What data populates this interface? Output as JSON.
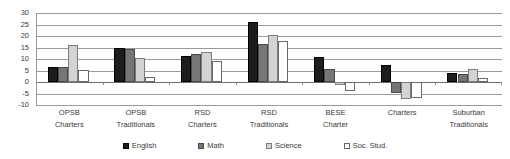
{
  "chart_data": {
    "type": "bar",
    "title": "",
    "subtitle": "",
    "xlabel": "",
    "ylabel": "",
    "ylim": [
      -10,
      30
    ],
    "ytick_step": 5,
    "yticks": [
      30,
      25,
      20,
      15,
      10,
      5,
      0,
      -5,
      -10
    ],
    "ytick_labels": [
      "30",
      "25",
      "20",
      "15",
      "10",
      "5",
      "0",
      "-5",
      "-10"
    ],
    "grid": true,
    "legend_position": "bottom",
    "categories": [
      "OPSB\nCharters",
      "OPSB\nTraditionals",
      "RSD\nCharters",
      "RSD\nTraditionals",
      "BESE\nCharter",
      "Charters",
      "Suburban\nTraditionals"
    ],
    "category_lines": [
      [
        "OPSB",
        "Charters"
      ],
      [
        "OPSB",
        "Traditionals"
      ],
      [
        "RSD",
        "Charters"
      ],
      [
        "RSD",
        "Traditionals"
      ],
      [
        "BESE",
        "Charter"
      ],
      [
        "Charters",
        ""
      ],
      [
        "Suburban",
        "Traditionals"
      ]
    ],
    "series": [
      {
        "name": "English",
        "color": "#1d1d1d",
        "values": [
          6.5,
          14.8,
          11.2,
          26.0,
          11.0,
          7.3,
          4.0
        ]
      },
      {
        "name": "Math",
        "color": "#767676",
        "values": [
          6.5,
          14.2,
          12.0,
          16.5,
          5.6,
          -4.7,
          3.6
        ]
      },
      {
        "name": "Science",
        "color": "#d3d3d3",
        "values": [
          16.0,
          10.5,
          12.9,
          20.5,
          -1.5,
          -7.3,
          5.6
        ]
      },
      {
        "name": "Soc. Stud.",
        "color": "#ffffff",
        "values": [
          5.3,
          2.0,
          9.3,
          18.0,
          -4.0,
          -7.0,
          1.8
        ]
      }
    ]
  },
  "legend": {
    "items": [
      {
        "label": "English"
      },
      {
        "label": "Math"
      },
      {
        "label": "Science"
      },
      {
        "label": "Soc. Stud."
      }
    ]
  }
}
